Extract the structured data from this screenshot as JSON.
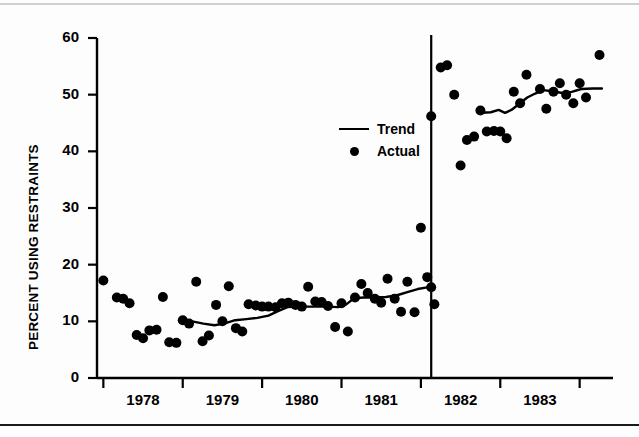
{
  "figure": {
    "background": "#ffffff",
    "ink_color": "#000000"
  },
  "legend": {
    "position": "inside-center",
    "entries": [
      {
        "label": "Trend",
        "marker": "line",
        "key_name": "trend-line-key"
      },
      {
        "label": "Actual",
        "marker": "dot",
        "key_name": "actual-dot-key"
      }
    ]
  },
  "chart_data": {
    "type": "scatter",
    "title": "",
    "subtitle": "",
    "xlabel": "",
    "ylabel": "PERCENT USING RESTRAINTS",
    "xlim": [
      1977.42,
      1983.92
    ],
    "ylim": [
      0,
      60
    ],
    "grid": false,
    "legend_position": "inside-center",
    "y_ticks": [
      0,
      10,
      20,
      30,
      40,
      50,
      60
    ],
    "y_tick_labels": [
      "0",
      "10",
      "20",
      "30",
      "40",
      "50",
      "60"
    ],
    "x_tick_labels": [
      "1978",
      "1979",
      "1980",
      "1981",
      "1982",
      "1983"
    ],
    "x_tick_label_positions": [
      1978.0,
      1979.0,
      1980.0,
      1981.0,
      1982.0,
      1983.0
    ],
    "x_tick_mark_positions": [
      1977.5,
      1978.5,
      1979.5,
      1980.5,
      1981.5,
      1982.5,
      1983.5
    ],
    "annotations": [
      {
        "type": "vertical-line",
        "name": "intervention-line",
        "x": 1981.63,
        "label": ""
      }
    ],
    "series": [
      {
        "name": "Actual",
        "type": "scatter",
        "marker": "filled-circle",
        "color": "#000000",
        "points": [
          [
            1977.5,
            17.2
          ],
          [
            1977.67,
            14.2
          ],
          [
            1977.75,
            14.0
          ],
          [
            1977.83,
            13.2
          ],
          [
            1977.92,
            7.6
          ],
          [
            1978.0,
            7.0
          ],
          [
            1978.08,
            8.4
          ],
          [
            1978.17,
            8.5
          ],
          [
            1978.25,
            14.3
          ],
          [
            1978.33,
            6.3
          ],
          [
            1978.42,
            6.2
          ],
          [
            1978.5,
            10.2
          ],
          [
            1978.58,
            9.6
          ],
          [
            1978.67,
            17.0
          ],
          [
            1978.75,
            6.5
          ],
          [
            1978.83,
            7.5
          ],
          [
            1978.92,
            12.9
          ],
          [
            1979.0,
            10.0
          ],
          [
            1979.08,
            16.2
          ],
          [
            1979.17,
            8.8
          ],
          [
            1979.25,
            8.2
          ],
          [
            1979.33,
            13.0
          ],
          [
            1979.42,
            12.8
          ],
          [
            1979.5,
            12.6
          ],
          [
            1979.58,
            12.6
          ],
          [
            1979.67,
            12.5
          ],
          [
            1979.75,
            13.2
          ],
          [
            1979.83,
            13.3
          ],
          [
            1979.92,
            12.9
          ],
          [
            1980.0,
            12.6
          ],
          [
            1980.08,
            16.1
          ],
          [
            1980.17,
            13.5
          ],
          [
            1980.25,
            13.4
          ],
          [
            1980.33,
            12.7
          ],
          [
            1980.42,
            9.0
          ],
          [
            1980.5,
            13.2
          ],
          [
            1980.58,
            8.2
          ],
          [
            1980.67,
            14.2
          ],
          [
            1980.75,
            16.6
          ],
          [
            1980.83,
            15.0
          ],
          [
            1980.92,
            14.0
          ],
          [
            1981.0,
            13.3
          ],
          [
            1981.08,
            17.5
          ],
          [
            1981.17,
            14.0
          ],
          [
            1981.25,
            11.7
          ],
          [
            1981.33,
            17.0
          ],
          [
            1981.42,
            11.6
          ],
          [
            1981.5,
            26.5
          ],
          [
            1981.58,
            17.8
          ],
          [
            1981.63,
            16.0
          ],
          [
            1981.67,
            13.0
          ],
          [
            1981.63,
            46.2
          ],
          [
            1981.75,
            54.8
          ],
          [
            1981.83,
            55.2
          ],
          [
            1981.92,
            50.0
          ],
          [
            1982.0,
            37.5
          ],
          [
            1982.08,
            42.0
          ],
          [
            1982.17,
            42.6
          ],
          [
            1982.25,
            47.2
          ],
          [
            1982.33,
            43.5
          ],
          [
            1982.42,
            43.6
          ],
          [
            1982.5,
            43.5
          ],
          [
            1982.58,
            42.3
          ],
          [
            1982.67,
            50.5
          ],
          [
            1982.75,
            48.5
          ],
          [
            1982.83,
            53.5
          ],
          [
            1983.0,
            51.0
          ],
          [
            1983.08,
            47.5
          ],
          [
            1983.17,
            50.5
          ],
          [
            1983.25,
            52.0
          ],
          [
            1983.33,
            50.0
          ],
          [
            1983.42,
            48.5
          ],
          [
            1983.5,
            52.0
          ],
          [
            1983.58,
            49.5
          ],
          [
            1983.75,
            57.0
          ]
        ]
      },
      {
        "name": "Trend",
        "type": "line",
        "color": "#000000",
        "segments": [
          {
            "name": "pre-intervention-trend",
            "points": [
              [
                1978.48,
                10.1
              ],
              [
                1978.62,
                10.0
              ],
              [
                1978.76,
                9.6
              ],
              [
                1978.9,
                9.3
              ],
              [
                1979.02,
                9.6
              ],
              [
                1979.16,
                10.2
              ],
              [
                1979.3,
                10.4
              ],
              [
                1979.44,
                10.6
              ],
              [
                1979.58,
                11.0
              ],
              [
                1979.7,
                11.8
              ],
              [
                1979.82,
                12.5
              ],
              [
                1979.94,
                12.6
              ],
              [
                1980.06,
                12.6
              ],
              [
                1980.18,
                12.6
              ],
              [
                1980.32,
                12.6
              ],
              [
                1980.46,
                12.5
              ],
              [
                1980.56,
                13.0
              ],
              [
                1980.66,
                14.1
              ],
              [
                1980.78,
                14.2
              ],
              [
                1980.92,
                14.2
              ],
              [
                1981.06,
                14.3
              ],
              [
                1981.2,
                14.6
              ],
              [
                1981.34,
                15.2
              ],
              [
                1981.46,
                15.7
              ],
              [
                1981.58,
                16.0
              ]
            ]
          },
          {
            "name": "post-intervention-trend",
            "points": [
              [
                1982.26,
                46.8
              ],
              [
                1982.38,
                46.9
              ],
              [
                1982.48,
                47.3
              ],
              [
                1982.56,
                46.8
              ],
              [
                1982.64,
                47.3
              ],
              [
                1982.74,
                48.4
              ],
              [
                1982.84,
                49.5
              ],
              [
                1982.94,
                50.2
              ],
              [
                1983.04,
                50.8
              ],
              [
                1983.16,
                50.6
              ],
              [
                1983.28,
                50.3
              ],
              [
                1983.4,
                50.5
              ],
              [
                1983.52,
                51.0
              ],
              [
                1983.66,
                51.1
              ],
              [
                1983.78,
                51.1
              ]
            ]
          }
        ]
      }
    ]
  }
}
